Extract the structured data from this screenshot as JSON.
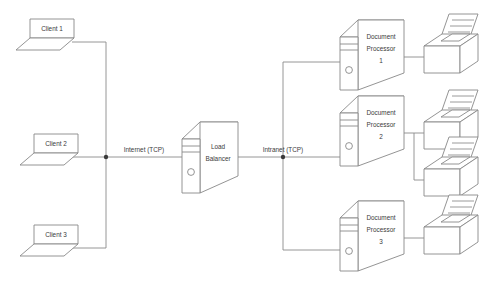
{
  "diagram": {
    "colors": {
      "stroke": "#888888",
      "fill": "#ffffff",
      "text": "#3b3b3b",
      "junction": "#3a3a3a"
    },
    "clients": [
      {
        "id": "client-1",
        "label": "Client 1"
      },
      {
        "id": "client-2",
        "label": "Client 2"
      },
      {
        "id": "client-3",
        "label": "Client 3"
      }
    ],
    "networks": [
      {
        "id": "internet-link",
        "label": "Internet (TCP)"
      },
      {
        "id": "intranet-link",
        "label": "Intranet (TCP)"
      }
    ],
    "load_balancer": {
      "id": "load-balancer",
      "label_line_1": "Load",
      "label_line_2": "Balancer"
    },
    "processors": [
      {
        "id": "document-processor-1",
        "label_line_1": "Document",
        "label_line_2": "Processor",
        "label_line_3": "1",
        "printers": 1
      },
      {
        "id": "document-processor-2",
        "label_line_1": "Document",
        "label_line_2": "Processor",
        "label_line_3": "2",
        "printers": 2
      },
      {
        "id": "document-processor-3",
        "label_line_1": "Document",
        "label_line_2": "Processor",
        "label_line_3": "3",
        "printers": 1
      }
    ]
  }
}
